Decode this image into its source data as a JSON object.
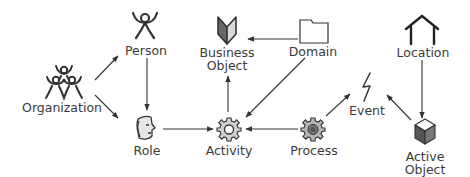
{
  "diagram": {
    "type": "entity-relationship",
    "nodes": [
      {
        "id": "organization",
        "label": "Organization",
        "icon": "people-pyramid-icon"
      },
      {
        "id": "person",
        "label": "Person",
        "icon": "person-icon"
      },
      {
        "id": "business_object",
        "label_line1": "Business",
        "label_line2": "Object",
        "icon": "open-book-icon"
      },
      {
        "id": "domain",
        "label": "Domain",
        "icon": "folder-icon"
      },
      {
        "id": "location",
        "label": "Location",
        "icon": "house-icon"
      },
      {
        "id": "role",
        "label": "Role",
        "icon": "mask-face-icon"
      },
      {
        "id": "activity",
        "label": "Activity",
        "icon": "gear-hollow-icon"
      },
      {
        "id": "process",
        "label": "Process",
        "icon": "gear-filled-icon"
      },
      {
        "id": "event",
        "label": "Event",
        "icon": "lightning-bolt-icon"
      },
      {
        "id": "active_object",
        "label_line1": "Active",
        "label_line2": "Object",
        "icon": "cube-icon"
      }
    ],
    "edges": [
      {
        "from": "organization",
        "to": "person"
      },
      {
        "from": "organization",
        "to": "role"
      },
      {
        "from": "person",
        "to": "role"
      },
      {
        "from": "domain",
        "to": "business_object"
      },
      {
        "from": "domain",
        "to": "activity"
      },
      {
        "from": "activity",
        "to": "business_object"
      },
      {
        "from": "role",
        "to": "activity"
      },
      {
        "from": "process",
        "to": "activity"
      },
      {
        "from": "process",
        "to": "event"
      },
      {
        "from": "location",
        "to": "active_object"
      },
      {
        "from": "active_object",
        "to": "event"
      }
    ],
    "colors": {
      "line": "#333333",
      "text": "#3a3a3a",
      "fill_light": "#e6e6e6",
      "fill_mid": "#8a8a8a",
      "fill_dark": "#555555"
    }
  }
}
